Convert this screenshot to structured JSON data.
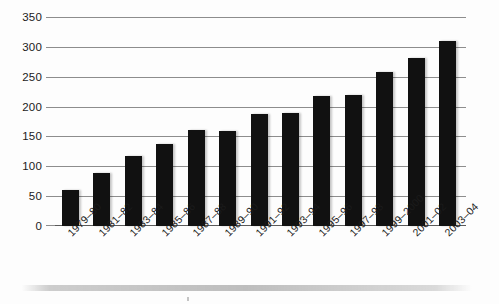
{
  "chart_data": {
    "type": "bar",
    "title": "",
    "subtitle": "",
    "xlabel": "",
    "ylabel": "",
    "ylim": [
      0,
      350
    ],
    "yticks": [
      0,
      50,
      100,
      150,
      200,
      250,
      300,
      350
    ],
    "grid": true,
    "legend": null,
    "bar_color": "#111111",
    "gridline_color": "#8d8d8d",
    "categories": [
      "1979–80",
      "1981–82",
      "1983–84",
      "1985–86",
      "1987–88",
      "1989–90",
      "1991–92",
      "1993–94",
      "1995–96",
      "1997–98",
      "1999–2000",
      "2001–02",
      "2003–04"
    ],
    "values": [
      60,
      88,
      117,
      138,
      161,
      159,
      188,
      189,
      218,
      220,
      258,
      281,
      310
    ],
    "series": [
      {
        "name": "",
        "values": [
          60,
          88,
          117,
          138,
          161,
          159,
          188,
          189,
          218,
          220,
          258,
          281,
          310
        ]
      }
    ]
  }
}
